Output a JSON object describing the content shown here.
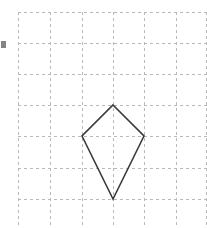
{
  "figure": {
    "type": "geometry-diagram",
    "canvas": {
      "width": 207,
      "height": 228,
      "background": "#ffffff"
    },
    "grid": {
      "label": "dashed square grid",
      "cell_size": 31,
      "color": "#b9b9b9",
      "stroke_width": 1,
      "dash_pattern": "3 3",
      "x_lines": [
        18,
        50,
        82,
        113,
        144,
        176,
        207
      ],
      "y_lines": [
        12,
        43,
        74,
        105,
        136,
        168,
        199
      ],
      "columns": 6,
      "rows": 6
    },
    "shape": {
      "name": "kite",
      "sides": 4,
      "color": "#3a3a3a",
      "stroke_width": 1.6,
      "fill": "none",
      "vertices": [
        {
          "name": "top",
          "x": 113,
          "y": 105
        },
        {
          "name": "right",
          "x": 144,
          "y": 136
        },
        {
          "name": "bottom",
          "x": 113,
          "y": 199
        },
        {
          "name": "left",
          "x": 82,
          "y": 136
        }
      ],
      "points_attr": "113,105 144,136 113,199 82,136"
    },
    "artifact": {
      "name": "left-edge-mark",
      "color": "#6f6f6f"
    }
  }
}
